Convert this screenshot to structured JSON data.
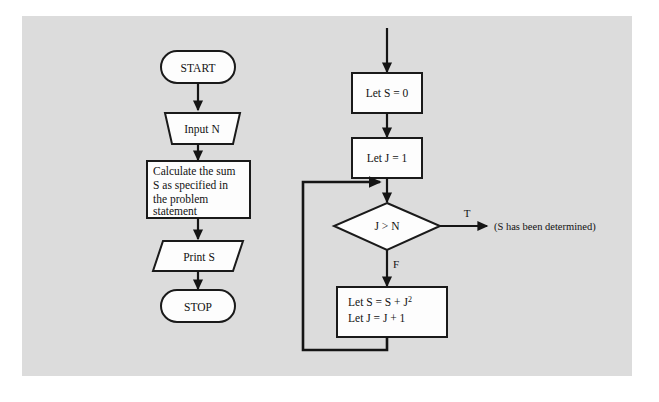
{
  "diagram": {
    "panel_color": "#dcdcdc",
    "shape_fill": "#fdfdfd",
    "line_color": "#151515",
    "left_column": {
      "start_terminal": "START",
      "input_step": "Input N",
      "process_lines": [
        "Calculate the sum",
        "S as specified in",
        "the problem",
        "statement"
      ],
      "output_step": "Print S",
      "stop_terminal": "STOP"
    },
    "right_column": {
      "init_s": "Let S = 0",
      "init_j": "Let J = 1",
      "decision": "J > N",
      "branch_true_label": "T",
      "branch_false_label": "F",
      "true_annotation": "(S has been determined)",
      "loop_body_line1_prefix": "Let S  =  S  +  J",
      "loop_body_line1_exponent": "2",
      "loop_body_line2": "Let J  =  J  +  1"
    }
  }
}
